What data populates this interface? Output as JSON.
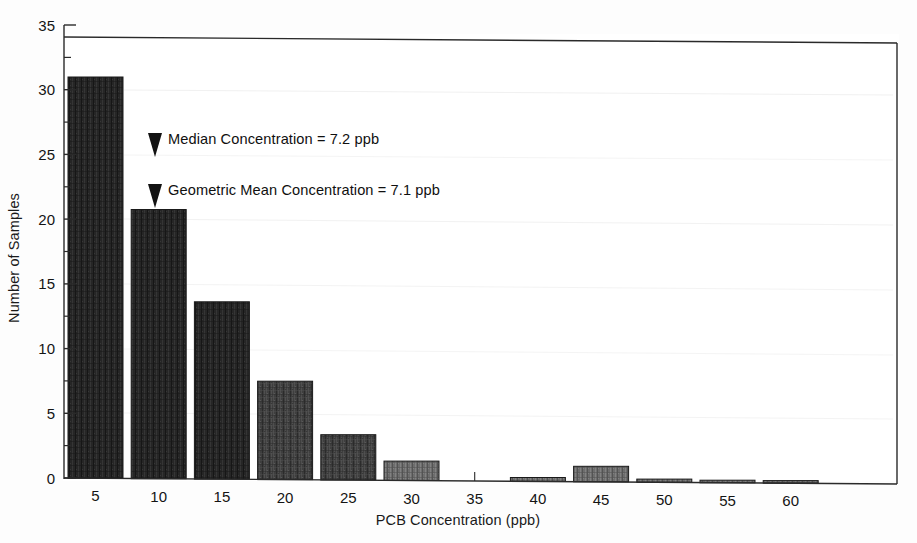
{
  "chart_data": {
    "type": "bar",
    "title": "",
    "xlabel": "PCB Concentration (ppb)",
    "ylabel": "Number of Samples",
    "categories": [
      "5",
      "10",
      "15",
      "20",
      "25",
      "30",
      "35",
      "40",
      "45",
      "50",
      "55",
      "60"
    ],
    "values": [
      31,
      20.8,
      13.7,
      7.6,
      3.5,
      1.5,
      0,
      0.3,
      1.2,
      0.25,
      0.2,
      0.2
    ],
    "xlim": [
      2.5,
      63
    ],
    "ylim": [
      0,
      35
    ],
    "ytick_labels": [
      "0",
      "5",
      "10",
      "15",
      "20",
      "25",
      "30",
      "35"
    ],
    "ytick_values": [
      0,
      5,
      10,
      15,
      20,
      25,
      30,
      35
    ],
    "yminor_step": 2.5,
    "grid": "faint-horizontal",
    "legend": "none",
    "bar_color": "#3b3b3b",
    "bar_edge_color": "#1a1a1a",
    "axis_color": "#2a2a2a",
    "annotations": [
      {
        "id": "median",
        "marker": "down-triangle",
        "label": "Median Concentration = 7.2 ppb",
        "y_value": 25.9,
        "x_value": 9.2
      },
      {
        "id": "geometric-mean",
        "marker": "down-triangle",
        "label": "Geometric Mean Concentration = 7.1 ppb",
        "y_value": 21.9,
        "x_value": 9.2
      }
    ]
  },
  "axes": {
    "x_title": "PCB Concentration (ppb)",
    "y_title": "Number of Samples",
    "x_ticks": [
      "5",
      "10",
      "15",
      "20",
      "25",
      "30",
      "35",
      "40",
      "45",
      "50",
      "55",
      "60"
    ],
    "y_ticks": [
      "0",
      "5",
      "10",
      "15",
      "20",
      "25",
      "30",
      "35"
    ]
  },
  "annotations": {
    "median_label": "Median Concentration = 7.2 ppb",
    "geometric_mean_label": "Geometric Mean Concentration = 7.1 ppb"
  },
  "colors": {
    "bar_fill": "#3b3b3b",
    "bar_stroke": "#171717",
    "axis": "#262626",
    "text": "#111111",
    "grid": "#e2e2e2",
    "background": "#ffffff"
  }
}
